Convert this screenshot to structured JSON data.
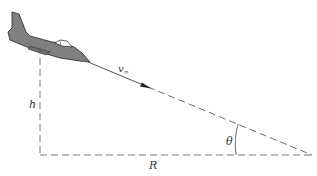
{
  "diagram": {
    "labels": {
      "velocity": "v",
      "velocity_sub": "∞",
      "height": "h",
      "range": "R",
      "angle": "θ"
    },
    "colors": {
      "aircraft_fill": "#808080",
      "aircraft_stroke": "#222222",
      "line": "#444444",
      "background": "#ffffff"
    },
    "elements": [
      {
        "name": "aircraft",
        "description": "jet aircraft in descending glide"
      },
      {
        "name": "flight-path",
        "description": "dashed line along glide path with velocity arrow"
      },
      {
        "name": "height-line",
        "description": "vertical dashed line"
      },
      {
        "name": "range-line",
        "description": "horizontal dashed line"
      },
      {
        "name": "angle-arc",
        "description": "glide angle between flight path and ground"
      }
    ]
  }
}
